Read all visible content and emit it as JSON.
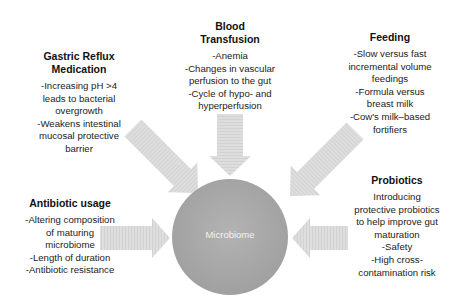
{
  "diagram": {
    "center": {
      "label": "Microbiome",
      "color": "#a9a9a9"
    },
    "arrow_color": "#dcdcdc",
    "factors": [
      {
        "id": "gastric-reflux",
        "title_lines": [
          "Gastric Reflux",
          "Medication"
        ],
        "lines": [
          "-Increasing pH >4",
          "leads to bacterial",
          "overgrowth",
          "-Weakens intestinal",
          "mucosal protective",
          "barrier"
        ]
      },
      {
        "id": "blood-transfusion",
        "title_lines": [
          "Blood",
          "Transfusion"
        ],
        "lines": [
          "-Anemia",
          "-Changes in vascular",
          "perfusion to the gut",
          "-Cycle of hypo- and",
          "hyperperfusion"
        ]
      },
      {
        "id": "feeding",
        "title_lines": [
          "Feeding"
        ],
        "lines": [
          "-Slow versus fast",
          "incremental volume",
          "feedings",
          "-Formula versus",
          "breast milk",
          "-Cow's milk–based",
          "fortifiers"
        ]
      },
      {
        "id": "antibiotic-usage",
        "title_lines": [
          "Antibiotic usage"
        ],
        "lines": [
          "-Altering composition",
          "of maturing",
          "microbiome",
          "-Length of duration",
          "-Antibiotic resistance"
        ]
      },
      {
        "id": "probiotics",
        "title_lines": [
          "Probiotics"
        ],
        "lines": [
          "Introducing",
          "protective probiotics",
          "to help improve gut",
          "maturation",
          "-Safety",
          "-High cross-",
          "contamination risk"
        ]
      }
    ]
  }
}
